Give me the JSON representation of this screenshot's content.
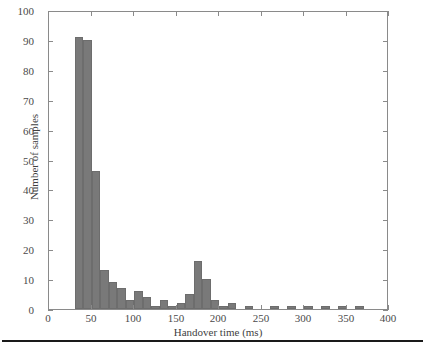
{
  "figure": {
    "background_color": "#ffffff",
    "frame_color": "#8a8a8a",
    "page_rule_color": "#1a1a1a"
  },
  "chart_data": {
    "type": "bar",
    "title": "",
    "subtitle": "",
    "xlabel": "Handover time (ms)",
    "ylabel": "Number of samples",
    "xlim": [
      0,
      400
    ],
    "ylim": [
      0,
      100
    ],
    "xticks": [
      0,
      50,
      100,
      150,
      200,
      250,
      300,
      350,
      400
    ],
    "xtick_labels": [
      "0",
      "50",
      "100",
      "150",
      "200",
      "250",
      "300",
      "350",
      "400"
    ],
    "yticks": [
      0,
      10,
      20,
      30,
      40,
      50,
      60,
      70,
      80,
      90,
      100
    ],
    "ytick_labels": [
      "0",
      "10",
      "20",
      "30",
      "40",
      "50",
      "60",
      "70",
      "80",
      "90",
      "100"
    ],
    "grid": false,
    "legend": null,
    "bar_color": "#797979",
    "bar_edge_color": "#6d6d6d",
    "bin_width": 10,
    "categories": [
      30,
      40,
      50,
      60,
      70,
      80,
      90,
      100,
      110,
      120,
      130,
      140,
      150,
      160,
      170,
      180,
      190,
      200,
      210,
      220,
      230,
      240,
      250,
      260,
      270,
      280,
      290,
      300,
      310,
      320,
      330,
      340,
      350,
      360
    ],
    "values": [
      91,
      90,
      46,
      13,
      9,
      7,
      3,
      6,
      4,
      1,
      3,
      1,
      2,
      5,
      16,
      10,
      3,
      1,
      2,
      0,
      1,
      0,
      0,
      1,
      0,
      1,
      0,
      1,
      0,
      1,
      0,
      1,
      0,
      1
    ],
    "annotations": []
  }
}
